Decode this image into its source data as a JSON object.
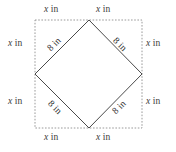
{
  "figure": {
    "outer_shape": {
      "name": "outer-square",
      "stroke_color": "#9a9a9a",
      "stroke_style": "dashed",
      "x": 35,
      "y": 20,
      "width": 107,
      "height": 108
    },
    "inner_shape": {
      "name": "inner-diamond",
      "stroke_color": "#4a4a4a",
      "stroke_style": "solid",
      "vertices": [
        {
          "label": "top",
          "x": 89,
          "y": 20
        },
        {
          "label": "right",
          "x": 142,
          "y": 74
        },
        {
          "label": "bottom",
          "x": 89,
          "y": 128
        },
        {
          "label": "left",
          "x": 35,
          "y": 74
        }
      ]
    },
    "background_color": "#ffffff"
  },
  "labels": {
    "side_segments": [
      {
        "id": "top-left",
        "variable": "x",
        "unit": "in"
      },
      {
        "id": "top-right",
        "variable": "x",
        "unit": "in"
      },
      {
        "id": "left-upper",
        "variable": "x",
        "unit": "in"
      },
      {
        "id": "left-lower",
        "variable": "x",
        "unit": "in"
      },
      {
        "id": "right-upper",
        "variable": "x",
        "unit": "in"
      },
      {
        "id": "right-lower",
        "variable": "x",
        "unit": "in"
      },
      {
        "id": "bottom-left",
        "variable": "x",
        "unit": "in"
      },
      {
        "id": "bottom-right",
        "variable": "x",
        "unit": "in"
      }
    ],
    "diagonals": [
      {
        "id": "diagonal-top-left",
        "value": "8",
        "unit": "in",
        "text": "8 in"
      },
      {
        "id": "diagonal-top-right",
        "value": "8",
        "unit": "in",
        "text": "8 in"
      },
      {
        "id": "diagonal-bottom-left",
        "value": "8",
        "unit": "in",
        "text": "8 in"
      },
      {
        "id": "diagonal-bottom-right",
        "value": "8",
        "unit": "in",
        "text": "8 in"
      }
    ],
    "variable_text": "x",
    "unit_text": "in"
  }
}
